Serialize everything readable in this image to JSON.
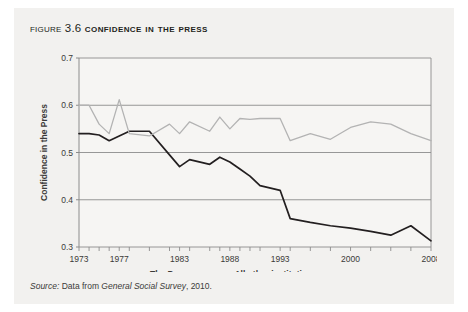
{
  "figure": {
    "label_word": "Figure",
    "number": "3.6",
    "title": "Confidence in the Press"
  },
  "source": {
    "prefix": "Source:",
    "text_before": " Data from ",
    "work": "General Social Survey",
    "text_after": ", 2010."
  },
  "legend": {
    "items": [
      {
        "label": "The Press",
        "color": "#231f20"
      },
      {
        "label": "All other institutions",
        "color": "#b3b3b3"
      }
    ]
  },
  "colors": {
    "page_background": "#f2f1ef",
    "plot_background": "#f6f5f3",
    "gridline": "#8c8c8c",
    "frame": "#8c8c8c",
    "press_line": "#231f20",
    "other_line": "#b3b3b3",
    "text": "#231f20"
  },
  "chart_data": {
    "type": "line",
    "title": "Confidence in the Press",
    "xlabel": "",
    "ylabel": "Confidence in the Press",
    "ylim": [
      0.3,
      0.7
    ],
    "yticks": [
      0.3,
      0.4,
      0.5,
      0.6,
      0.7
    ],
    "ytick_labels": [
      "0.3",
      "0.4",
      "0.5",
      "0.6",
      "0.7"
    ],
    "xlim": [
      1973,
      2008
    ],
    "xticks": [
      1973,
      1977,
      1983,
      1988,
      1993,
      2000,
      2008
    ],
    "xtick_labels": [
      "1973",
      "1977",
      "1983",
      "1988",
      "1993",
      "2000",
      "2008"
    ],
    "grid": true,
    "legend_position": "below",
    "x": [
      1973,
      1974,
      1975,
      1976,
      1977,
      1978,
      1980,
      1982,
      1983,
      1984,
      1986,
      1987,
      1988,
      1989,
      1990,
      1991,
      1993,
      1994,
      1996,
      1998,
      2000,
      2002,
      2004,
      2006,
      2008
    ],
    "series": [
      {
        "name": "The Press",
        "color": "#231f20",
        "values": [
          0.54,
          0.54,
          0.537,
          0.525,
          0.535,
          0.545,
          0.545,
          0.495,
          0.47,
          0.485,
          0.475,
          0.49,
          0.48,
          0.465,
          0.45,
          0.43,
          0.42,
          0.36,
          0.352,
          0.345,
          0.34,
          0.333,
          0.325,
          0.345,
          0.313
        ]
      },
      {
        "name": "All other institutions",
        "color": "#b3b3b3",
        "values": [
          0.6,
          0.6,
          0.56,
          0.54,
          0.612,
          0.54,
          0.535,
          0.56,
          0.54,
          0.565,
          0.545,
          0.575,
          0.55,
          0.572,
          0.57,
          0.572,
          0.572,
          0.525,
          0.54,
          0.528,
          0.553,
          0.565,
          0.56,
          0.54,
          0.525
        ]
      }
    ]
  }
}
